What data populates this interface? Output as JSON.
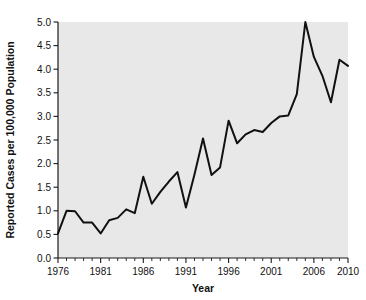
{
  "chart_data": {
    "type": "line",
    "title": "",
    "subtitle": "",
    "xlabel": "Year",
    "ylabel": "Reported Cases per 100,000 Population",
    "xlim": [
      1976,
      2010
    ],
    "ylim": [
      0.0,
      5.0
    ],
    "grid": false,
    "legend": null,
    "legend_position": "none",
    "annotations": [],
    "x_tick_labels": [
      "1976",
      "1981",
      "1986",
      "1991",
      "1996",
      "2001",
      "2006",
      "2010"
    ],
    "x_tick_values": [
      1976,
      1981,
      1986,
      1991,
      1996,
      2001,
      2006,
      2010
    ],
    "x_minor_tick_step": 1,
    "y_tick_labels": [
      "0.0",
      "0.5",
      "1.0",
      "1.5",
      "2.0",
      "2.5",
      "3.0",
      "3.5",
      "4.0",
      "4.5",
      "5.0"
    ],
    "y_tick_values": [
      0.0,
      0.5,
      1.0,
      1.5,
      2.0,
      2.5,
      3.0,
      3.5,
      4.0,
      4.5,
      5.0
    ],
    "x": [
      1976,
      1977,
      1978,
      1979,
      1980,
      1981,
      1982,
      1983,
      1984,
      1985,
      1986,
      1987,
      1988,
      1989,
      1990,
      1991,
      1992,
      1993,
      1994,
      1995,
      1996,
      1997,
      1998,
      1999,
      2000,
      2001,
      2002,
      2003,
      2004,
      2005,
      2006,
      2007,
      2008,
      2009,
      2010
    ],
    "values": [
      0.52,
      1.0,
      0.99,
      0.75,
      0.75,
      0.52,
      0.8,
      0.85,
      1.03,
      0.95,
      1.72,
      1.15,
      1.4,
      1.62,
      1.82,
      1.07,
      1.77,
      2.53,
      1.76,
      1.92,
      2.91,
      2.43,
      2.62,
      2.71,
      2.67,
      2.86,
      3.0,
      3.02,
      3.47,
      5.0,
      4.26,
      3.86,
      3.3,
      4.2,
      4.07
    ],
    "series": [
      {
        "name": "Reported Cases per 100,000 Population",
        "color": "#111111",
        "values": [
          0.52,
          1.0,
          0.99,
          0.75,
          0.75,
          0.52,
          0.8,
          0.85,
          1.03,
          0.95,
          1.72,
          1.15,
          1.4,
          1.62,
          1.82,
          1.07,
          1.77,
          2.53,
          1.76,
          1.92,
          2.91,
          2.43,
          2.62,
          2.71,
          2.67,
          2.86,
          3.0,
          3.02,
          3.47,
          5.0,
          4.26,
          3.86,
          3.3,
          4.2,
          4.07
        ]
      }
    ]
  },
  "style": {
    "plot_background": "#e8e8e8",
    "line_color": "#111111",
    "axis_color": "#1a1a1a",
    "text_color": "#111111",
    "figure_background": "#ffffff"
  }
}
